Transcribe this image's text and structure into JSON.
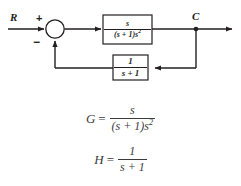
{
  "diagram": {
    "type": "control-system-block-diagram",
    "background_color": "#ffffff",
    "line_color": "#231f20",
    "input_label": "R",
    "output_label": "C",
    "summing_junction": {
      "input_sign": "+",
      "feedback_sign": "−"
    },
    "forward_block": {
      "name": "G",
      "numerator": "s",
      "denominator_prefix": "(s + 1)s",
      "denominator_exponent": "2"
    },
    "feedback_block": {
      "name": "H",
      "numerator": "1",
      "denominator": "s + 1"
    }
  },
  "equations": {
    "text_color": "#3b3b3d",
    "items": [
      {
        "lhs": "G",
        "equals": "=",
        "numerator": "s",
        "denominator_prefix": "(s + 1)s",
        "denominator_exponent": "2"
      },
      {
        "lhs": "H",
        "equals": "=",
        "numerator": "1",
        "denominator": "s + 1",
        "denominator_exponent": ""
      }
    ]
  }
}
